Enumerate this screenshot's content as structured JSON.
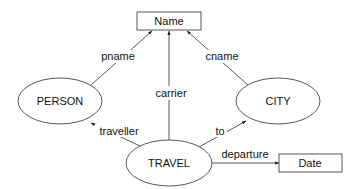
{
  "diagram": {
    "type": "entity-relationship",
    "colors": {
      "stroke": "#444444",
      "text": "#111111",
      "background": "#ffffff"
    },
    "nodes": [
      {
        "id": "name",
        "label": "Name",
        "shape": "rectangle"
      },
      {
        "id": "person",
        "label": "PERSON",
        "shape": "ellipse"
      },
      {
        "id": "city",
        "label": "CITY",
        "shape": "ellipse"
      },
      {
        "id": "travel",
        "label": "TRAVEL",
        "shape": "ellipse"
      },
      {
        "id": "date",
        "label": "Date",
        "shape": "rectangle"
      }
    ],
    "edges": [
      {
        "id": "pname",
        "label": "pname",
        "from": "PERSON",
        "to": "Name"
      },
      {
        "id": "cname",
        "label": "cname",
        "from": "CITY",
        "to": "Name"
      },
      {
        "id": "carrier",
        "label": "carrier",
        "from": "TRAVEL",
        "to": "Name"
      },
      {
        "id": "traveller",
        "label": "traveller",
        "from": "TRAVEL",
        "to": "PERSON"
      },
      {
        "id": "to",
        "label": "to",
        "from": "TRAVEL",
        "to": "CITY"
      },
      {
        "id": "departure",
        "label": "departure",
        "from": "TRAVEL",
        "to": "Date"
      }
    ]
  }
}
